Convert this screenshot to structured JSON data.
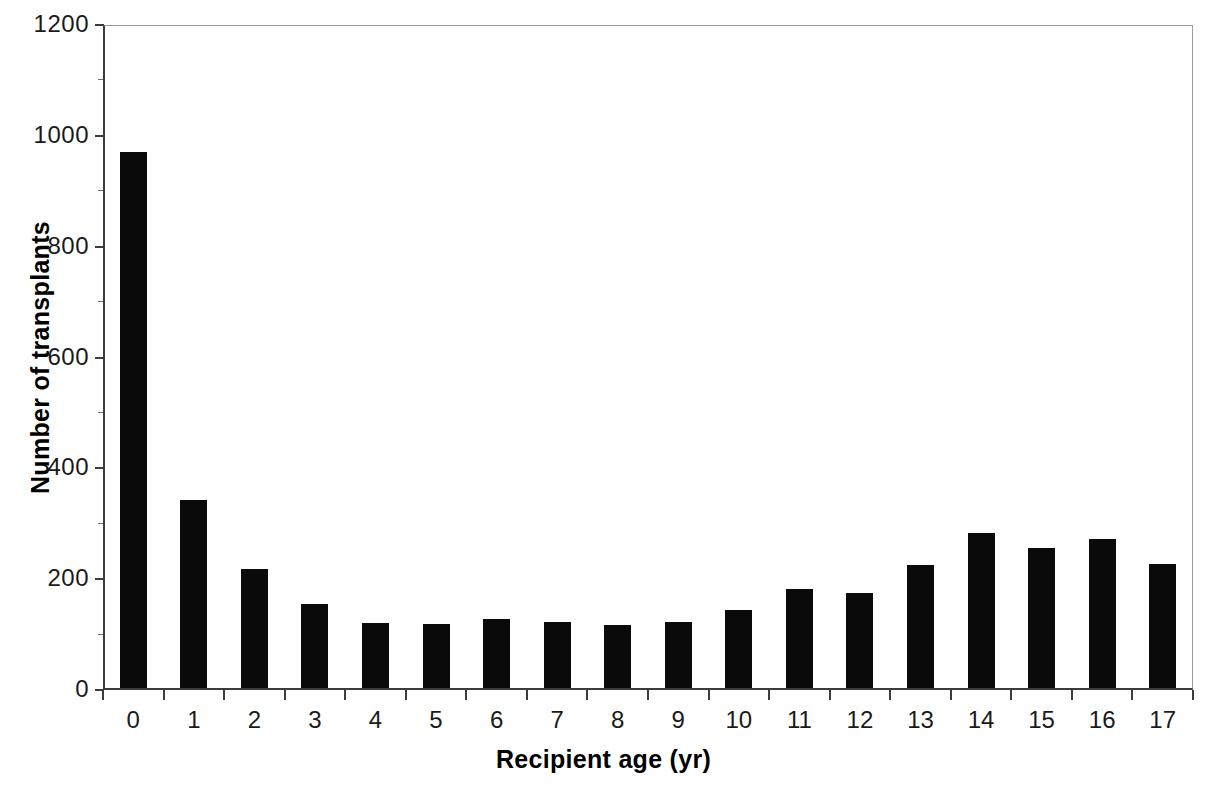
{
  "chart_data": {
    "type": "bar",
    "title": "",
    "xlabel": "Recipient age (yr)",
    "ylabel": "Number of transplants",
    "categories": [
      "0",
      "1",
      "2",
      "3",
      "4",
      "5",
      "6",
      "7",
      "8",
      "9",
      "10",
      "11",
      "12",
      "13",
      "14",
      "15",
      "16",
      "17"
    ],
    "values": [
      968,
      339,
      214,
      151,
      118,
      115,
      124,
      119,
      114,
      120,
      140,
      179,
      171,
      222,
      279,
      252,
      268,
      224
    ],
    "ylim": [
      0,
      1200
    ],
    "ytick_labels": [
      "0",
      "200",
      "400",
      "600",
      "800",
      "1000",
      "1200"
    ],
    "ytick_values": [
      0,
      200,
      400,
      600,
      800,
      1000,
      1200
    ],
    "yminor_tick_values": [
      100,
      300,
      500,
      700,
      900,
      1100
    ],
    "grid": false,
    "legend": null,
    "series": [
      {
        "name": "Number of transplants",
        "color": "#0a0a0a",
        "values": [
          968,
          339,
          214,
          151,
          118,
          115,
          124,
          119,
          114,
          120,
          140,
          179,
          171,
          222,
          279,
          252,
          268,
          224
        ]
      }
    ]
  },
  "axes": {
    "y_axis_title": "Number of transplants",
    "x_axis_title": "Recipient age (yr)"
  },
  "colors": {
    "bar": "#0a0a0a",
    "axis": "#3c3c3c",
    "frame": "#9a9a9a",
    "text": "#1a1a1a",
    "background": "#ffffff"
  }
}
